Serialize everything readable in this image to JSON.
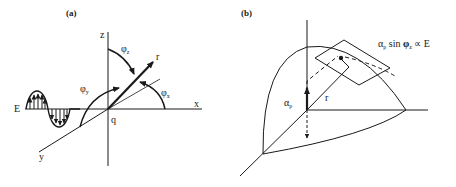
{
  "panel_a": {
    "label": "(a)",
    "axis_z": "z",
    "axis_x": "x",
    "axis_y": "y",
    "vector": "r",
    "origin": "q",
    "field": "E",
    "angle_z": "φ",
    "angle_z_sub": "z",
    "angle_y": "φ",
    "angle_y_sub": "y",
    "angle_x": "φ",
    "angle_x_sub": "x"
  },
  "panel_b": {
    "label": "(b)",
    "vector": "r",
    "alpha": "α",
    "alpha_sub": "p",
    "formula_alpha": "α",
    "formula_alpha_sub": "p",
    "formula_mid": " sin ",
    "formula_phi": "φ",
    "formula_phi_sub": "z",
    "formula_tail": " ∝ E"
  },
  "colors": {
    "ink": "#1a1a1a",
    "background": "#ffffff"
  }
}
